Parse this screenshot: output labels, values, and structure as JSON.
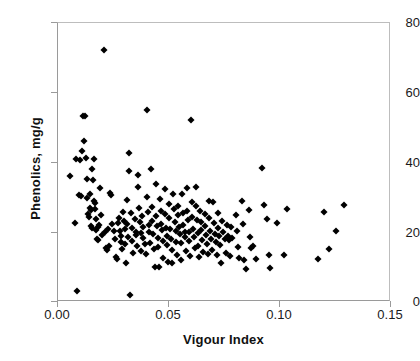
{
  "chart_data": {
    "type": "scatter",
    "title": "",
    "xlabel": "Vigour Index",
    "ylabel": "Phenolics, mg/g",
    "xlim": [
      0.0,
      0.15
    ],
    "ylim": [
      0,
      80
    ],
    "xticks": [
      "0.00",
      "0.05",
      "0.10",
      "0.15"
    ],
    "xtick_values": [
      0.0,
      0.05,
      0.1,
      0.15
    ],
    "yticks": [
      "0",
      "20",
      "40",
      "60",
      "80"
    ],
    "ytick_values": [
      0,
      20,
      40,
      60,
      80
    ],
    "grid": false,
    "legend": null,
    "marker": "diamond",
    "marker_color": "#000000",
    "series": [
      {
        "name": "samples",
        "points": [
          [
            0.0055,
            36.2
          ],
          [
            0.0075,
            22.7
          ],
          [
            0.008,
            40.9
          ],
          [
            0.0085,
            3.1
          ],
          [
            0.0095,
            30.6
          ],
          [
            0.0098,
            40.6
          ],
          [
            0.0105,
            30.4
          ],
          [
            0.011,
            43.2
          ],
          [
            0.0112,
            53.3
          ],
          [
            0.0122,
            53.3
          ],
          [
            0.0118,
            46.2
          ],
          [
            0.0125,
            41.2
          ],
          [
            0.013,
            35.4
          ],
          [
            0.0132,
            29.8
          ],
          [
            0.0134,
            25.1
          ],
          [
            0.0138,
            24.3
          ],
          [
            0.0142,
            31.1
          ],
          [
            0.0145,
            27.0
          ],
          [
            0.0148,
            26.4
          ],
          [
            0.015,
            21.7
          ],
          [
            0.0152,
            21.1
          ],
          [
            0.0155,
            38.0
          ],
          [
            0.0158,
            34.9
          ],
          [
            0.016,
            29.1
          ],
          [
            0.0162,
            41.0
          ],
          [
            0.0165,
            28.3
          ],
          [
            0.0168,
            26.8
          ],
          [
            0.017,
            23.9
          ],
          [
            0.0172,
            20.6
          ],
          [
            0.0175,
            18.2
          ],
          [
            0.0178,
            17.9
          ],
          [
            0.018,
            21.4
          ],
          [
            0.0185,
            22.1
          ],
          [
            0.019,
            32.6
          ],
          [
            0.0195,
            25.0
          ],
          [
            0.0198,
            19.3
          ],
          [
            0.0205,
            72.3
          ],
          [
            0.021,
            20.1
          ],
          [
            0.0215,
            15.6
          ],
          [
            0.022,
            14.9
          ],
          [
            0.0225,
            21.0
          ],
          [
            0.023,
            16.1
          ],
          [
            0.0235,
            31.2
          ],
          [
            0.024,
            30.8
          ],
          [
            0.0245,
            22.3
          ],
          [
            0.025,
            20.4
          ],
          [
            0.0255,
            18.0
          ],
          [
            0.026,
            13.0
          ],
          [
            0.0265,
            12.4
          ],
          [
            0.027,
            22.6
          ],
          [
            0.0275,
            24.0
          ],
          [
            0.028,
            20.5
          ],
          [
            0.0282,
            17.3
          ],
          [
            0.0285,
            18.9
          ],
          [
            0.029,
            15.2
          ],
          [
            0.0295,
            25.9
          ],
          [
            0.0298,
            23.1
          ],
          [
            0.03,
            20.9
          ],
          [
            0.0302,
            16.5
          ],
          [
            0.0305,
            11.1
          ],
          [
            0.031,
            29.2
          ],
          [
            0.0312,
            22.5
          ],
          [
            0.0315,
            18.6
          ],
          [
            0.032,
            42.6
          ],
          [
            0.0322,
            37.6
          ],
          [
            0.0325,
            1.9
          ],
          [
            0.033,
            25.4
          ],
          [
            0.0332,
            21.2
          ],
          [
            0.0335,
            17.6
          ],
          [
            0.034,
            14.0
          ],
          [
            0.0345,
            23.8
          ],
          [
            0.035,
            20.0
          ],
          [
            0.0352,
            19.1
          ],
          [
            0.0355,
            16.0
          ],
          [
            0.036,
            36.5
          ],
          [
            0.0362,
            33.1
          ],
          [
            0.0365,
            26.9
          ],
          [
            0.037,
            22.8
          ],
          [
            0.0372,
            19.7
          ],
          [
            0.0375,
            14.5
          ],
          [
            0.038,
            24.6
          ],
          [
            0.0382,
            21.6
          ],
          [
            0.0385,
            18.4
          ],
          [
            0.039,
            16.7
          ],
          [
            0.0395,
            13.9
          ],
          [
            0.04,
            55.0
          ],
          [
            0.0402,
            30.1
          ],
          [
            0.0405,
            25.7
          ],
          [
            0.041,
            22.0
          ],
          [
            0.0412,
            20.2
          ],
          [
            0.0415,
            17.0
          ],
          [
            0.042,
            38.1
          ],
          [
            0.0422,
            27.2
          ],
          [
            0.0425,
            23.3
          ],
          [
            0.043,
            19.5
          ],
          [
            0.0432,
            15.3
          ],
          [
            0.0435,
            10.0
          ],
          [
            0.044,
            33.8
          ],
          [
            0.0442,
            24.8
          ],
          [
            0.0445,
            21.8
          ],
          [
            0.045,
            18.3
          ],
          [
            0.0452,
            15.8
          ],
          [
            0.0455,
            9.9
          ],
          [
            0.046,
            29.4
          ],
          [
            0.0462,
            26.1
          ],
          [
            0.0465,
            22.4
          ],
          [
            0.047,
            20.7
          ],
          [
            0.0472,
            17.4
          ],
          [
            0.0475,
            12.7
          ],
          [
            0.048,
            32.3
          ],
          [
            0.0482,
            25.2
          ],
          [
            0.0485,
            21.3
          ],
          [
            0.049,
            19.0
          ],
          [
            0.0492,
            16.3
          ],
          [
            0.0495,
            11.5
          ],
          [
            0.05,
            28.0
          ],
          [
            0.0502,
            24.2
          ],
          [
            0.0505,
            20.8
          ],
          [
            0.051,
            18.1
          ],
          [
            0.0512,
            15.0
          ],
          [
            0.0515,
            11.2
          ],
          [
            0.052,
            30.9
          ],
          [
            0.0522,
            26.6
          ],
          [
            0.0525,
            23.0
          ],
          [
            0.053,
            20.3
          ],
          [
            0.0532,
            17.1
          ],
          [
            0.0535,
            13.4
          ],
          [
            0.054,
            27.6
          ],
          [
            0.0542,
            24.9
          ],
          [
            0.0545,
            21.5
          ],
          [
            0.055,
            19.4
          ],
          [
            0.0552,
            16.8
          ],
          [
            0.0555,
            12.1
          ],
          [
            0.056,
            31.0
          ],
          [
            0.0562,
            25.5
          ],
          [
            0.0565,
            22.2
          ],
          [
            0.057,
            20.1
          ],
          [
            0.0572,
            18.7
          ],
          [
            0.0575,
            14.6
          ],
          [
            0.058,
            32.8
          ],
          [
            0.0582,
            26.2
          ],
          [
            0.0585,
            23.6
          ],
          [
            0.059,
            20.0
          ],
          [
            0.0592,
            17.5
          ],
          [
            0.0595,
            13.2
          ],
          [
            0.06,
            52.2
          ],
          [
            0.0602,
            28.6
          ],
          [
            0.0605,
            24.4
          ],
          [
            0.061,
            21.0
          ],
          [
            0.0612,
            18.5
          ],
          [
            0.0615,
            15.4
          ],
          [
            0.062,
            33.0
          ],
          [
            0.0622,
            27.4
          ],
          [
            0.0625,
            23.5
          ],
          [
            0.063,
            19.8
          ],
          [
            0.0632,
            16.2
          ],
          [
            0.0635,
            12.9
          ],
          [
            0.064,
            26.0
          ],
          [
            0.0642,
            22.9
          ],
          [
            0.0645,
            20.6
          ],
          [
            0.065,
            17.8
          ],
          [
            0.0652,
            14.2
          ],
          [
            0.066,
            25.3
          ],
          [
            0.0662,
            21.9
          ],
          [
            0.0665,
            19.2
          ],
          [
            0.067,
            16.6
          ],
          [
            0.0675,
            13.7
          ],
          [
            0.068,
            29.0
          ],
          [
            0.0682,
            24.1
          ],
          [
            0.0685,
            20.4
          ],
          [
            0.069,
            18.0
          ],
          [
            0.0695,
            14.8
          ],
          [
            0.07,
            28.8
          ],
          [
            0.0702,
            22.6
          ],
          [
            0.0705,
            19.6
          ],
          [
            0.071,
            17.2
          ],
          [
            0.0715,
            13.5
          ],
          [
            0.072,
            25.6
          ],
          [
            0.0722,
            21.1
          ],
          [
            0.0725,
            18.8
          ],
          [
            0.073,
            16.4
          ],
          [
            0.0735,
            11.3
          ],
          [
            0.074,
            23.2
          ],
          [
            0.0745,
            20.0
          ],
          [
            0.075,
            18.2
          ],
          [
            0.0755,
            14.1
          ],
          [
            0.076,
            22.0
          ],
          [
            0.0765,
            19.0
          ],
          [
            0.077,
            17.7
          ],
          [
            0.0775,
            13.1
          ],
          [
            0.078,
            21.4
          ],
          [
            0.0785,
            18.3
          ],
          [
            0.08,
            25.0
          ],
          [
            0.0805,
            20.5
          ],
          [
            0.081,
            15.9
          ],
          [
            0.0815,
            12.5
          ],
          [
            0.083,
            29.0
          ],
          [
            0.0835,
            22.3
          ],
          [
            0.084,
            12.0
          ],
          [
            0.0845,
            9.4
          ],
          [
            0.086,
            26.3
          ],
          [
            0.0865,
            18.6
          ],
          [
            0.087,
            15.5
          ],
          [
            0.088,
            16.1
          ],
          [
            0.089,
            12.2
          ],
          [
            0.092,
            38.5
          ],
          [
            0.093,
            27.7
          ],
          [
            0.094,
            23.9
          ],
          [
            0.095,
            13.4
          ],
          [
            0.0955,
            9.7
          ],
          [
            0.0985,
            22.7
          ],
          [
            0.102,
            13.5
          ],
          [
            0.103,
            26.6
          ],
          [
            0.117,
            12.3
          ],
          [
            0.12,
            25.7
          ],
          [
            0.122,
            15.2
          ],
          [
            0.125,
            20.3
          ],
          [
            0.129,
            27.8
          ]
        ]
      }
    ]
  }
}
